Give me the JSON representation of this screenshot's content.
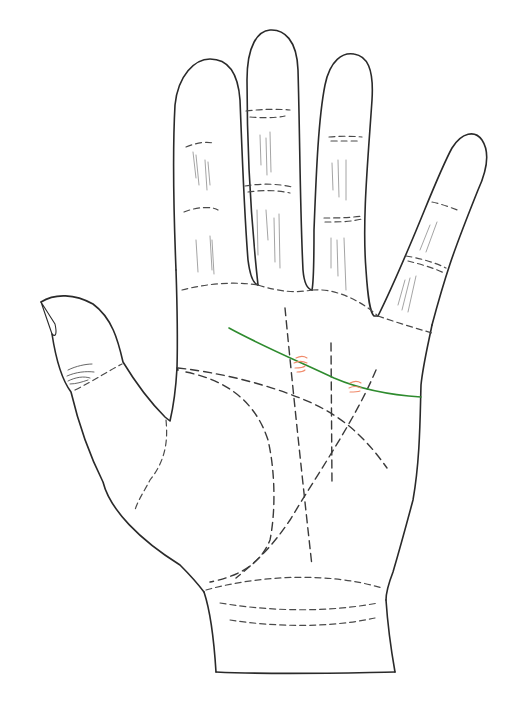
{
  "diagram": {
    "colors": {
      "outline": "#2a2a2a",
      "crease": "#4a4a4a",
      "fine_lines": "#9a9a9a",
      "highlighted_line": "#2e8b2e",
      "markers": "#f08a6a",
      "background": "#ffffff"
    },
    "highlighted_line": {
      "name": "heart-line",
      "color": "#2e8b2e"
    },
    "markers": [
      {
        "name": "break-marker-1",
        "x": 300,
        "y": 365
      },
      {
        "name": "break-marker-2",
        "x": 356,
        "y": 388
      }
    ]
  }
}
